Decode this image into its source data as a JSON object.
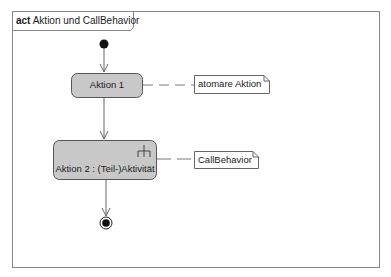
{
  "frame": {
    "keyword": "act",
    "name": "Aktion und CallBehavior"
  },
  "nodes": {
    "initial": {
      "type": "initial-node"
    },
    "action1": {
      "label": "Aktion 1",
      "type": "action"
    },
    "action2": {
      "label": "Aktion 2 : (Teil-)Aktivität",
      "type": "call-behavior-action"
    },
    "final": {
      "type": "activity-final-node"
    }
  },
  "notes": {
    "note1": {
      "text": "atomare Aktion"
    },
    "note2": {
      "text": "CallBehavior"
    }
  },
  "colors": {
    "action_fill": "#c8c8c8",
    "border": "#555555",
    "line": "#666666"
  }
}
